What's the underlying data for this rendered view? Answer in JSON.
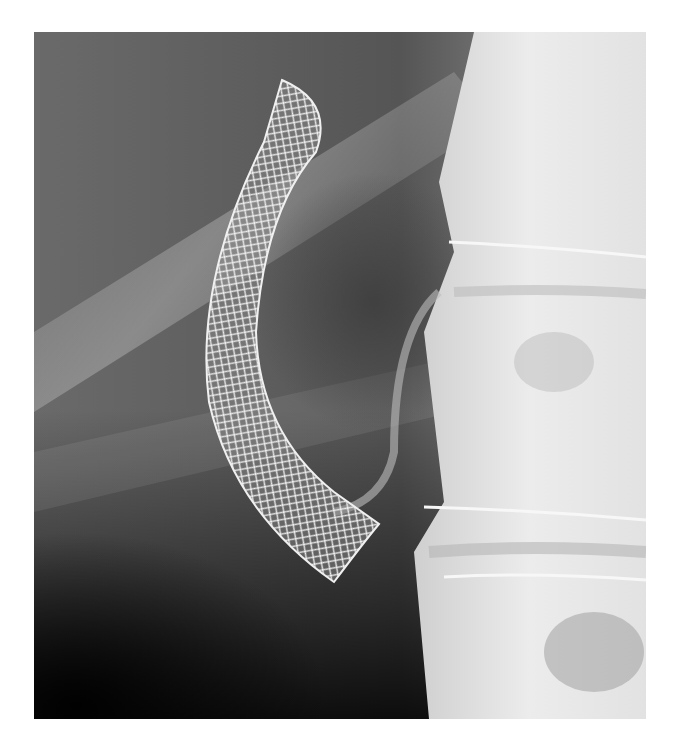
{
  "image": {
    "subject": "Radiograph of a curved metallic mesh stent adjacent to the lumbar spine",
    "alt": "X-ray showing curved wire mesh stent beside vertebrae"
  }
}
